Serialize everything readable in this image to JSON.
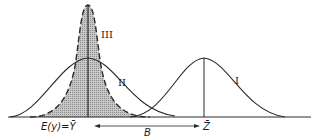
{
  "diagram": {
    "curves": [
      {
        "id": "I",
        "label": "I",
        "description": "distribution centered at Z-bar"
      },
      {
        "id": "II",
        "label": "II",
        "description": "wide distribution centered at E(y)"
      },
      {
        "id": "III",
        "label": "III",
        "description": "narrow shaded dashed distribution centered at E(y)"
      }
    ],
    "axis_labels": {
      "left_mean": "E(y)=Ȳ",
      "right_mean": "Z̄",
      "bias": "B"
    },
    "colors": {
      "line": "#2a2a2a",
      "shade": "#b0b0b0",
      "background": "#ffffff"
    }
  }
}
